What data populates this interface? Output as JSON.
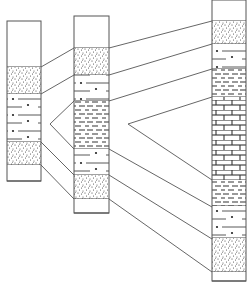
{
  "diagram": {
    "type": "stratigraphic-correlation",
    "title": "",
    "colors": {
      "line": "#555555",
      "background": "#ffffff",
      "dot": "#222222"
    },
    "lithology_legend": {
      "blank": "unfilled",
      "sandstone": "stippled dots",
      "siltstone": "dashes with dots",
      "mudstone": "short dashes",
      "limestone": "brick pattern"
    },
    "columns": [
      {
        "id": "col1",
        "x": 7,
        "width": 34,
        "layers": [
          {
            "lith": "blank",
            "top": 21,
            "bottom": 67
          },
          {
            "lith": "sandstone",
            "top": 67,
            "bottom": 94
          },
          {
            "lith": "siltstone",
            "top": 94,
            "bottom": 142
          },
          {
            "lith": "sandstone",
            "top": 142,
            "bottom": 165
          },
          {
            "lith": "blank",
            "top": 165,
            "bottom": 181
          }
        ]
      },
      {
        "id": "col2",
        "x": 74,
        "width": 35,
        "layers": [
          {
            "lith": "blank",
            "top": 16,
            "bottom": 48
          },
          {
            "lith": "sandstone",
            "top": 48,
            "bottom": 75
          },
          {
            "lith": "siltstone",
            "top": 75,
            "bottom": 101
          },
          {
            "lith": "mudstone",
            "top": 101,
            "bottom": 149
          },
          {
            "lith": "siltstone",
            "top": 149,
            "bottom": 175
          },
          {
            "lith": "sandstone",
            "top": 175,
            "bottom": 199
          },
          {
            "lith": "blank",
            "top": 199,
            "bottom": 213
          }
        ]
      },
      {
        "id": "col3",
        "x": 212,
        "width": 34,
        "layers": [
          {
            "lith": "blank",
            "top": 0,
            "bottom": 21
          },
          {
            "lith": "sandstone",
            "top": 21,
            "bottom": 44
          },
          {
            "lith": "siltstone",
            "top": 44,
            "bottom": 69
          },
          {
            "lith": "mudstone",
            "top": 69,
            "bottom": 97
          },
          {
            "lith": "limestone",
            "top": 97,
            "bottom": 180
          },
          {
            "lith": "mudstone",
            "top": 180,
            "bottom": 206
          },
          {
            "lith": "siltstone",
            "top": 206,
            "bottom": 238
          },
          {
            "lith": "sandstone",
            "top": 238,
            "bottom": 272
          },
          {
            "lith": "blank",
            "top": 272,
            "bottom": 281
          }
        ]
      }
    ],
    "correlation_lines": [
      {
        "from": [
          41,
          67
        ],
        "to": [
          74,
          48
        ]
      },
      {
        "from": [
          41,
          94
        ],
        "to": [
          74,
          75
        ]
      },
      {
        "from": [
          41,
          142
        ],
        "to": [
          74,
          175
        ]
      },
      {
        "from": [
          41,
          165
        ],
        "to": [
          74,
          199
        ]
      },
      {
        "from": [
          50,
          124
        ],
        "to": [
          74,
          101
        ]
      },
      {
        "from": [
          50,
          124
        ],
        "to": [
          74,
          149
        ]
      },
      {
        "from": [
          109,
          48
        ],
        "to": [
          212,
          21
        ]
      },
      {
        "from": [
          109,
          75
        ],
        "to": [
          212,
          44
        ]
      },
      {
        "from": [
          109,
          101
        ],
        "to": [
          212,
          69
        ]
      },
      {
        "from": [
          128,
          124
        ],
        "to": [
          212,
          97
        ]
      },
      {
        "from": [
          128,
          124
        ],
        "to": [
          212,
          180
        ]
      },
      {
        "from": [
          109,
          149
        ],
        "to": [
          212,
          207
        ]
      },
      {
        "from": [
          109,
          175
        ],
        "to": [
          212,
          239
        ]
      },
      {
        "from": [
          109,
          199
        ],
        "to": [
          212,
          272
        ]
      }
    ],
    "pinch_outs": [
      {
        "name": "mudstone-wedge-col1-col2",
        "vertex": [
          50,
          124
        ]
      },
      {
        "name": "limestone-wedge-col2-col3",
        "vertex": [
          128,
          124
        ]
      }
    ]
  }
}
